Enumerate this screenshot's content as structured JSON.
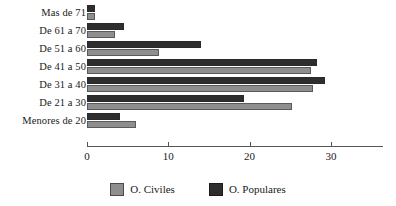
{
  "chart_data": {
    "type": "bar",
    "orientation": "horizontal",
    "title": "",
    "xlabel": "",
    "ylabel": "",
    "xlim": [
      0,
      36.5
    ],
    "grid": false,
    "legend_position": "bottom-center",
    "xticks": [
      0,
      10,
      20,
      30
    ],
    "xtick_labels": [
      "0",
      "10",
      "20",
      "30"
    ],
    "categories": [
      "Mas de 71",
      "De 61 a 70",
      "De 51 a 60",
      "De 41 a 50",
      "De 31 a 40",
      "De 21 a 30",
      "Menores de 20"
    ],
    "series": [
      {
        "name": "O. Civiles",
        "color": "#8e8e8e",
        "values": [
          1.0,
          3.4,
          8.8,
          27.5,
          27.8,
          25.2,
          6.0
        ]
      },
      {
        "name": "O. Populares",
        "color": "#2e2e2e",
        "values": [
          1.0,
          4.6,
          14.0,
          28.3,
          29.3,
          19.3,
          4.0
        ]
      }
    ]
  },
  "legend": {
    "items": [
      {
        "label": "O. Civiles",
        "color": "#8e8e8e"
      },
      {
        "label": "O. Populares",
        "color": "#2e2e2e"
      }
    ]
  }
}
